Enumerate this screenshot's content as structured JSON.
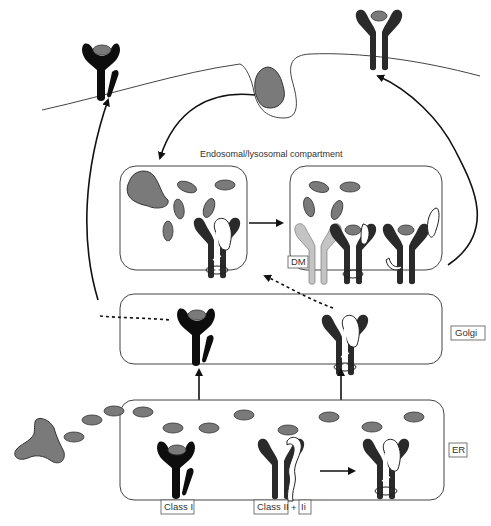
{
  "compartments": {
    "endosomal": "Endosomal/lysosomal compartment",
    "golgi": "Golgi",
    "er": "ER"
  },
  "labels": {
    "class_i": "Class I",
    "class_ii": "Class II",
    "plus": "+",
    "ii": "Ii",
    "dm": "DM"
  },
  "colors": {
    "peptide": "#7a7a7a",
    "class_i": "#0d0d0d",
    "class_ii": "#2a2a2a",
    "dm": "#c4c4c4",
    "invariant_chain": "#ffffff"
  }
}
